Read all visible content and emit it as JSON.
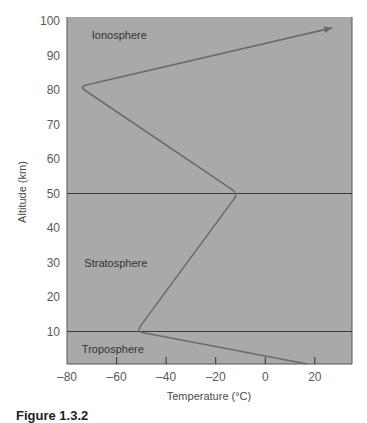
{
  "chart_data": {
    "type": "line",
    "title": "",
    "xlabel": "Temperature (°C)",
    "ylabel": "Altitude (km)",
    "xlim": [
      -80,
      35
    ],
    "ylim": [
      0,
      102
    ],
    "x_ticks": [
      -80,
      -60,
      -40,
      -20,
      0,
      20
    ],
    "y_ticks": [
      10,
      20,
      30,
      40,
      50,
      60,
      70,
      80,
      90,
      100
    ],
    "grid": false,
    "legend": null,
    "series": [
      {
        "name": "Temperature profile",
        "points": [
          {
            "temperature": 17,
            "altitude": 0
          },
          {
            "temperature": -52,
            "altitude": 10
          },
          {
            "temperature": -11,
            "altitude": 50
          },
          {
            "temperature": -75,
            "altitude": 81
          },
          {
            "temperature": 27,
            "altitude": 98
          }
        ],
        "arrow_at_end": true
      }
    ],
    "horizontal_lines": [
      {
        "altitude": 10,
        "meaning": "tropopause"
      },
      {
        "altitude": 50,
        "meaning": "stratopause"
      }
    ],
    "annotations": [
      {
        "text": "Ionosphere",
        "temperature": -70,
        "altitude": 96
      },
      {
        "text": "Stratosphere",
        "temperature": -73,
        "altitude": 30
      },
      {
        "text": "Troposphere",
        "temperature": -74,
        "altitude": 5
      }
    ],
    "colors": {
      "plot_background": "#a9a9a9",
      "curve": "#6b6b6b",
      "boundary_lines": "#3a3a3a"
    }
  },
  "caption": "Figure 1.3.2"
}
